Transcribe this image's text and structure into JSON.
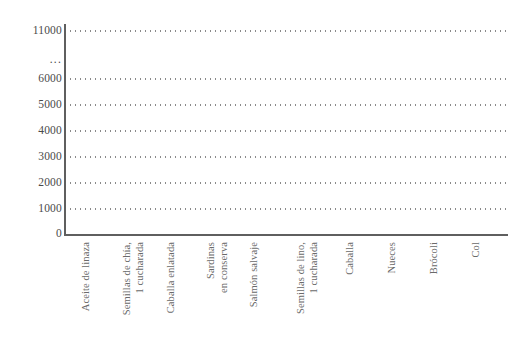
{
  "chart_data": {
    "type": "bar",
    "title": "",
    "xlabel": "",
    "ylabel": "",
    "ylim": [
      0,
      11000
    ],
    "grid": true,
    "legend": false,
    "axis_break": {
      "present": true,
      "marker": "...",
      "between": [
        6000,
        11000
      ]
    },
    "ytick_labels": [
      "0",
      "1000",
      "2000",
      "3000",
      "4000",
      "5000",
      "6000",
      "...",
      "11000"
    ],
    "ytick_values": [
      0,
      1000,
      2000,
      3000,
      4000,
      5000,
      6000,
      null,
      11000
    ],
    "categories": [
      "Aceite de linaza",
      "Semillas de chía,\n1 cucharada",
      "Caballa enlatada",
      "Sardinas\nen conserva",
      "Salmón salvaje",
      "Semillas de lino,\n1 cucharada",
      "Caballa",
      "Nueces",
      "Brócoli",
      "Col"
    ],
    "values": [
      11000,
      5100,
      2950,
      3200,
      2500,
      950,
      700,
      800,
      130,
      150
    ],
    "bar_color": "#b4b4b4",
    "bar_edge_color": "#6b6b6b",
    "grid_color": "#8a8a8a",
    "axis_color": "#5f5f5f",
    "label_color": "#6a6a6a",
    "background": "#ffffff"
  },
  "axis": {
    "ticks": [
      {
        "label": "11000",
        "top": 24
      },
      {
        "label": "...",
        "top": 53
      },
      {
        "label": "6000",
        "top": 72
      },
      {
        "label": "5000",
        "top": 98
      },
      {
        "label": "4000",
        "top": 124
      },
      {
        "label": "3000",
        "top": 150
      },
      {
        "label": "2000",
        "top": 176
      },
      {
        "label": "1000",
        "top": 202
      },
      {
        "label": "0",
        "top": 227
      }
    ],
    "gridlines": [
      30,
      78,
      104,
      130,
      156,
      182,
      208
    ]
  },
  "bars": [
    {
      "name": "aceite-de-linaza",
      "left": 72,
      "width": 33,
      "top": 30,
      "height": 204,
      "value": 11000
    },
    {
      "name": "semillas-de-chia",
      "left": 116,
      "width": 31,
      "top": 104,
      "height": 130,
      "value": 5100
    },
    {
      "name": "caballa-enlatada",
      "left": 156,
      "width": 33,
      "top": 157,
      "height": 77,
      "value": 2950
    },
    {
      "name": "sardinas-en-conserva",
      "left": 199,
      "width": 31,
      "top": 151,
      "height": 83,
      "value": 3200
    },
    {
      "name": "salmon-salvaje",
      "left": 239,
      "width": 31,
      "top": 169,
      "height": 65,
      "value": 2500
    },
    {
      "name": "semillas-de-lino",
      "left": 290,
      "width": 31,
      "top": 209,
      "height": 25,
      "value": 950
    },
    {
      "name": "caballa",
      "left": 334,
      "width": 31,
      "top": 215,
      "height": 19,
      "value": 700
    },
    {
      "name": "nueces",
      "left": 374,
      "width": 33,
      "top": 213,
      "height": 21,
      "value": 800
    },
    {
      "name": "brocoli",
      "left": 419,
      "width": 31,
      "top": 230,
      "height": 4,
      "value": 130
    },
    {
      "name": "col",
      "left": 461,
      "width": 31,
      "top": 230,
      "height": 4,
      "value": 150
    }
  ],
  "xlabels": [
    {
      "name": "aceite-de-linaza",
      "left": 80,
      "text": "Aceite de linaza"
    },
    {
      "name": "semillas-de-chia",
      "left": 121,
      "text": "Semillas de chía,\n1 cucharada"
    },
    {
      "name": "caballa-enlatada",
      "left": 165,
      "text": "Caballa enlatada"
    },
    {
      "name": "sardinas-en-conserva",
      "left": 205,
      "text": "Sardinas\nen conserva"
    },
    {
      "name": "salmon-salvaje",
      "left": 248,
      "text": "Salmón salvaje"
    },
    {
      "name": "semillas-de-lino",
      "left": 295,
      "text": "Semillas de lino,\n1 cucharada"
    },
    {
      "name": "caballa",
      "left": 344,
      "text": "Caballa"
    },
    {
      "name": "nueces",
      "left": 386,
      "text": "Nueces"
    },
    {
      "name": "brocoli",
      "left": 428,
      "text": "Brócoli"
    },
    {
      "name": "col",
      "left": 470,
      "text": "Col"
    }
  ]
}
